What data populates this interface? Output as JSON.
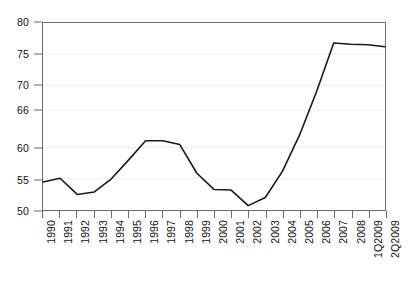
{
  "chart_data": {
    "type": "line",
    "title": "",
    "subtitle": "",
    "xlabel": "",
    "ylabel": "",
    "categories": [
      "1990",
      "1991",
      "1992",
      "1993",
      "1994",
      "1995",
      "1996",
      "1997",
      "1998",
      "1999",
      "2000",
      "2001",
      "2002",
      "2003",
      "2004",
      "2005",
      "2006",
      "2007",
      "2008",
      "1Q2009",
      "2Q2009"
    ],
    "series": [
      {
        "name": "series-1",
        "values": [
          54.5,
          55.1,
          52.5,
          52.9,
          55.0,
          58.0,
          61.1,
          61.1,
          60.5,
          55.9,
          53.3,
          53.2,
          50.7,
          52.0,
          56.2,
          62.0,
          69.0,
          76.8,
          76.6,
          76.5,
          76.2
        ]
      }
    ],
    "ylim": [
      50,
      80
    ],
    "yticks": [
      50,
      55,
      60,
      66,
      70,
      75,
      80
    ],
    "ytick_labels": [
      "50",
      "55",
      "60",
      "66",
      "70",
      "75",
      "80"
    ],
    "grid": true,
    "grid_axis": "y",
    "legend": false,
    "legend_position": "none",
    "line_color": "#1a1a1a",
    "grid_color": "#ededed",
    "frame_color": "#6b6b6b",
    "background_color": "#ffffff",
    "annotations": []
  }
}
